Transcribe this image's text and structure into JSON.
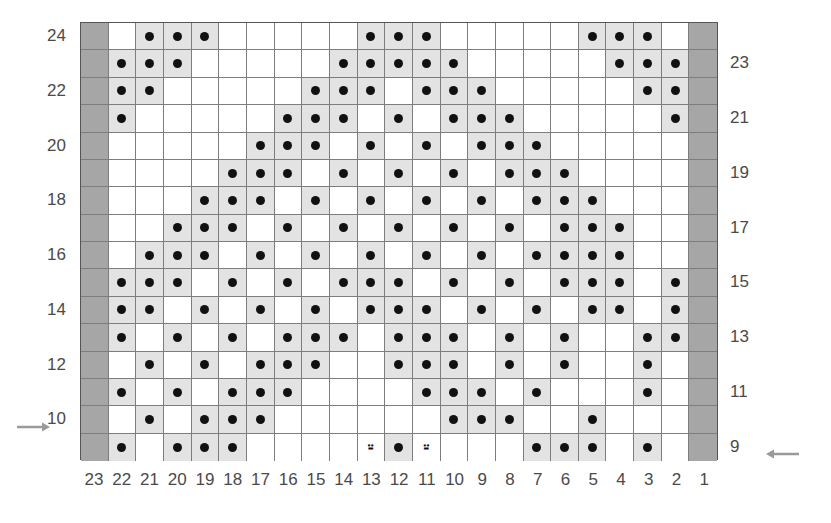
{
  "chart_data": {
    "type": "heatmap",
    "title": "",
    "symbols": {
      "dot": "purl-stitch-dot",
      "right-lean": "right-leaning-decrease",
      "left-lean": "left-leaning-decrease",
      "edge": "selvedge-dark-cell",
      "shade": "shaded-cell",
      "plain": "empty-cell"
    },
    "colors": {
      "edge_cell": "#a6a6a6",
      "shaded_cell": "#e3e3e3",
      "plain_cell": "#ffffff",
      "grid_line": "#7d7d7d",
      "border": "#555555",
      "dot": "#111111",
      "label": "#4a4a4a",
      "arrow": "#9a9a9a",
      "background": "#ffffff"
    },
    "columns": 23,
    "rows": 16,
    "column_labels": [
      "23",
      "22",
      "21",
      "20",
      "19",
      "18",
      "17",
      "16",
      "15",
      "14",
      "13",
      "12",
      "11",
      "10",
      "9",
      "8",
      "7",
      "6",
      "5",
      "4",
      "3",
      "2",
      "1"
    ],
    "row_labels_left": [
      "24",
      "",
      "22",
      "",
      "20",
      "",
      "18",
      "",
      "16",
      "",
      "14",
      "",
      "12",
      "",
      "10",
      ""
    ],
    "row_labels_right": [
      "",
      "23",
      "",
      "21",
      "",
      "19",
      "",
      "17",
      "",
      "15",
      "",
      "13",
      "",
      "11",
      "",
      "9"
    ],
    "row_numbers_top_to_bottom": [
      24,
      23,
      22,
      21,
      20,
      19,
      18,
      17,
      16,
      15,
      14,
      13,
      12,
      11,
      10,
      9
    ],
    "grid": [
      [
        "edge",
        "plain",
        "dot",
        "dot",
        "dot",
        "plain",
        "plain",
        "plain",
        "plain",
        "plain",
        "dot",
        "dot",
        "dot",
        "plain",
        "plain",
        "plain",
        "plain",
        "plain",
        "dot",
        "dot",
        "dot",
        "plain",
        "edge"
      ],
      [
        "edge",
        "dot",
        "dot",
        "dot",
        "plain",
        "plain",
        "plain",
        "plain",
        "plain",
        "dot",
        "dot",
        "dot",
        "dot",
        "dot",
        "plain",
        "plain",
        "plain",
        "plain",
        "plain",
        "dot",
        "dot",
        "dot",
        "edge"
      ],
      [
        "edge",
        "dot",
        "dot",
        "plain",
        "plain",
        "plain",
        "plain",
        "plain",
        "dot",
        "dot",
        "dot",
        "plain",
        "dot",
        "dot",
        "dot",
        "plain",
        "plain",
        "plain",
        "plain",
        "plain",
        "dot",
        "dot",
        "edge"
      ],
      [
        "edge",
        "dot",
        "plain",
        "plain",
        "plain",
        "plain",
        "plain",
        "dot",
        "dot",
        "dot",
        "plain",
        "dot",
        "plain",
        "dot",
        "dot",
        "dot",
        "plain",
        "plain",
        "plain",
        "plain",
        "plain",
        "dot",
        "edge"
      ],
      [
        "edge",
        "plain",
        "plain",
        "plain",
        "plain",
        "plain",
        "dot",
        "dot",
        "dot",
        "plain",
        "dot",
        "plain",
        "dot",
        "plain",
        "dot",
        "dot",
        "dot",
        "plain",
        "plain",
        "plain",
        "plain",
        "plain",
        "edge"
      ],
      [
        "edge",
        "plain",
        "plain",
        "plain",
        "plain",
        "dot",
        "dot",
        "dot",
        "plain",
        "dot",
        "plain",
        "dot",
        "plain",
        "dot",
        "plain",
        "dot",
        "dot",
        "dot",
        "plain",
        "plain",
        "plain",
        "plain",
        "edge"
      ],
      [
        "edge",
        "plain",
        "plain",
        "plain",
        "dot",
        "dot",
        "dot",
        "plain",
        "dot",
        "plain",
        "dot",
        "plain",
        "dot",
        "plain",
        "dot",
        "plain",
        "dot",
        "dot",
        "dot",
        "plain",
        "plain",
        "plain",
        "edge"
      ],
      [
        "edge",
        "plain",
        "plain",
        "dot",
        "dot",
        "dot",
        "plain",
        "dot",
        "plain",
        "dot",
        "plain",
        "dot",
        "plain",
        "dot",
        "plain",
        "dot",
        "plain",
        "dot",
        "dot",
        "dot",
        "plain",
        "plain",
        "edge"
      ],
      [
        "edge",
        "plain",
        "dot",
        "dot",
        "dot",
        "plain",
        "dot",
        "plain",
        "dot",
        "plain",
        "dot",
        "plain",
        "dot",
        "plain",
        "dot",
        "plain",
        "dot",
        "dot",
        "dot",
        "dot",
        "plain",
        "plain",
        "edge"
      ],
      [
        "edge",
        "dot",
        "dot",
        "dot",
        "plain",
        "dot",
        "plain",
        "dot",
        "plain",
        "dot",
        "dot",
        "dot",
        "plain",
        "dot",
        "plain",
        "dot",
        "plain",
        "dot",
        "dot",
        "dot",
        "plain",
        "dot",
        "edge"
      ],
      [
        "edge",
        "dot",
        "dot",
        "plain",
        "dot",
        "plain",
        "dot",
        "plain",
        "dot",
        "plain",
        "dot",
        "dot",
        "dot",
        "plain",
        "dot",
        "plain",
        "dot",
        "plain",
        "dot",
        "dot",
        "plain",
        "dot",
        "edge"
      ],
      [
        "edge",
        "dot",
        "plain",
        "dot",
        "plain",
        "dot",
        "plain",
        "dot",
        "dot",
        "dot",
        "plain",
        "dot",
        "dot",
        "dot",
        "plain",
        "dot",
        "plain",
        "dot",
        "plain",
        "plain",
        "dot",
        "dot",
        "edge"
      ],
      [
        "edge",
        "plain",
        "dot",
        "plain",
        "dot",
        "plain",
        "dot",
        "dot",
        "dot",
        "plain",
        "plain",
        "dot",
        "dot",
        "dot",
        "plain",
        "dot",
        "plain",
        "dot",
        "plain",
        "plain",
        "dot",
        "plain",
        "edge"
      ],
      [
        "edge",
        "dot",
        "plain",
        "dot",
        "plain",
        "dot",
        "dot",
        "dot",
        "plain",
        "plain",
        "plain",
        "plain",
        "dot",
        "dot",
        "dot",
        "plain",
        "dot",
        "plain",
        "plain",
        "plain",
        "dot",
        "plain",
        "edge"
      ],
      [
        "edge",
        "plain",
        "dot",
        "plain",
        "dot",
        "dot",
        "dot",
        "plain",
        "plain",
        "plain",
        "plain",
        "plain",
        "plain",
        "dot",
        "dot",
        "dot",
        "plain",
        "plain",
        "dot",
        "plain",
        "plain",
        "plain",
        "edge"
      ],
      [
        "edge",
        "dot",
        "plain",
        "dot",
        "dot",
        "dot",
        "plain",
        "plain",
        "plain",
        "plain",
        "right-lean",
        "dot",
        "left-lean",
        "plain",
        "plain",
        "plain",
        "dot",
        "dot",
        "dot",
        "plain",
        "dot",
        "plain",
        "edge"
      ]
    ],
    "arrows": [
      {
        "name": "row-10-direction-arrow",
        "direction": "right",
        "row_label": "10",
        "side": "left"
      },
      {
        "name": "row-9-direction-arrow",
        "direction": "left",
        "row_label": "9",
        "side": "right"
      }
    ],
    "glyph_chars": {
      "right-lean": "⸚",
      "left-lean": "⸚"
    }
  }
}
